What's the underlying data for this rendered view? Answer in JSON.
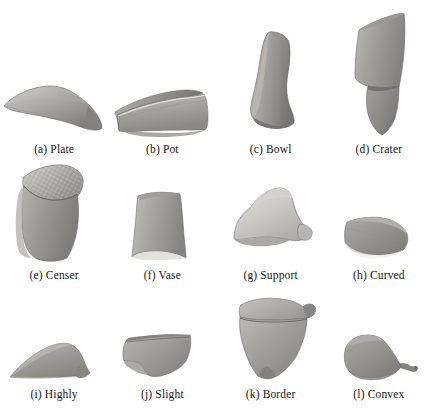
{
  "figure": {
    "kind": "image-grid",
    "columns": 4,
    "rows": 3,
    "background_color": "#ffffff",
    "caption_color": "#161616"
  },
  "palette": {
    "sherd_light": "#d8d6d2",
    "sherd_mid": "#a9a7a3",
    "sherd_dark": "#7d7b78",
    "sherd_darkest": "#5f5d5b",
    "outline": "#6e6c69",
    "page": "#ffffff"
  },
  "items": [
    {
      "id": "a",
      "label": "(a) Plate",
      "letter": "(a)",
      "name": "Plate",
      "icon": "sherd-plate-icon"
    },
    {
      "id": "b",
      "label": "(b) Pot",
      "letter": "(b)",
      "name": "Pot",
      "icon": "sherd-pot-icon"
    },
    {
      "id": "c",
      "label": "(c) Bowl",
      "letter": "(c)",
      "name": "Bowl",
      "icon": "sherd-bowl-icon"
    },
    {
      "id": "d",
      "label": "(d) Crater",
      "letter": "(d)",
      "name": "Crater",
      "icon": "sherd-crater-icon"
    },
    {
      "id": "e",
      "label": "(e) Censer",
      "letter": "(e)",
      "name": "Censer",
      "icon": "sherd-censer-icon"
    },
    {
      "id": "f",
      "label": "(f) Vase",
      "letter": "(f)",
      "name": "Vase",
      "icon": "sherd-vase-icon"
    },
    {
      "id": "g",
      "label": "(g) Support",
      "letter": "(g)",
      "name": "Support",
      "icon": "sherd-support-icon"
    },
    {
      "id": "h",
      "label": "(h) Curved",
      "letter": "(h)",
      "name": "Curved",
      "icon": "sherd-curved-icon"
    },
    {
      "id": "i",
      "label": "(i) Highly",
      "letter": "(i)",
      "name": "Highly",
      "icon": "sherd-highly-icon"
    },
    {
      "id": "j",
      "label": "(j) Slight",
      "letter": "(j)",
      "name": "Slight",
      "icon": "sherd-slight-icon"
    },
    {
      "id": "k",
      "label": "(k) Border",
      "letter": "(k)",
      "name": "Border",
      "icon": "sherd-border-icon"
    },
    {
      "id": "l",
      "label": "(l) Convex",
      "letter": "(l)",
      "name": "Convex",
      "icon": "sherd-convex-icon"
    }
  ]
}
